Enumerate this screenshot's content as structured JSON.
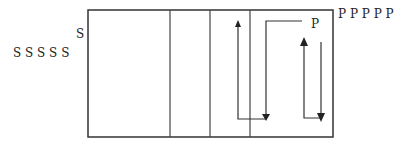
{
  "labels": {
    "s_single": "S",
    "s_row": "S S S S S",
    "p_single": "P",
    "p_row": "P P P P P"
  },
  "colors": {
    "line": "#333333",
    "background": "#ffffff"
  }
}
